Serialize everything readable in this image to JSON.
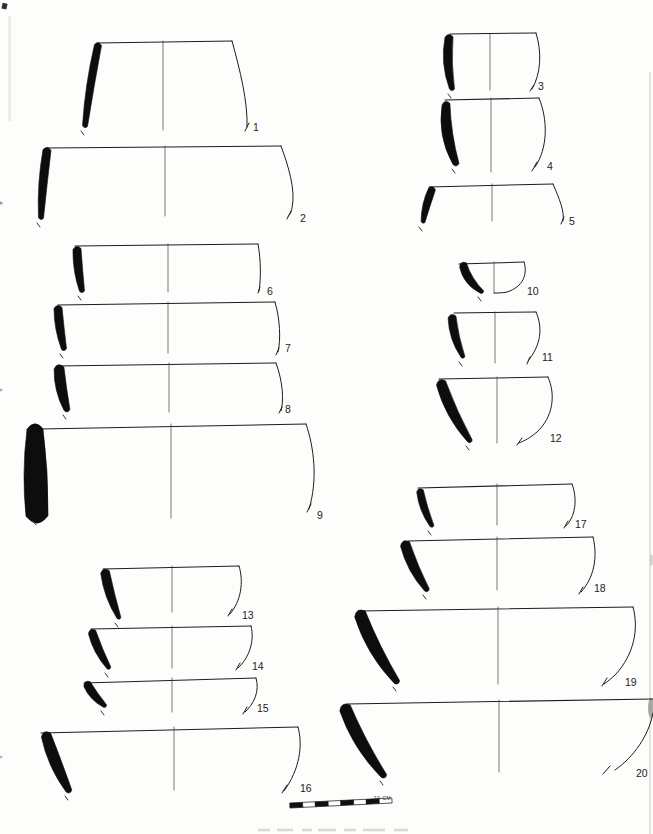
{
  "figure": {
    "type": "archaeological-pottery-profile-plate",
    "vessel_count": 20,
    "line_color": "#1d1d1d",
    "background_color": "#fdfdfc",
    "scale_bar": {
      "x": 290,
      "y": 808,
      "x2": 392,
      "y2": 803,
      "height": 5,
      "segments": 8,
      "label": "10 CM",
      "label_pos": [
        374,
        800
      ]
    },
    "vessels": [
      {
        "num": "1",
        "rim": [
          97,
          43,
          232,
          41
        ],
        "center": [
          163,
          41,
          130
        ],
        "profile": "M232,41 C240,70 248,102 247,127 M249,123 L245,131",
        "sherd": {
          "top": [
            98,
            45
          ],
          "bottom": [
            85,
            126
          ],
          "bow": -2,
          "w": [
            7,
            9,
            5
          ]
        },
        "label_pos": [
          253,
          131
        ]
      },
      {
        "num": "2",
        "rim": [
          47,
          148,
          281,
          146
        ],
        "center": [
          165,
          146,
          216
        ],
        "profile": "M281,146 C288,165 296,190 292,208 C291,213 290,215 288,216 M291,211 L287,219",
        "sherd": {
          "top": [
            47,
            150
          ],
          "bottom": [
            41,
            218
          ],
          "bow": -2,
          "w": [
            8,
            10,
            5
          ]
        },
        "label_pos": [
          300,
          222
        ]
      },
      {
        "num": "3",
        "rim": [
          450,
          34,
          536,
          33
        ],
        "center": [
          490,
          34,
          90
        ],
        "profile": "M536,33 C542,52 541,74 532,89 M534,85 L530,91",
        "sherd": {
          "top": [
            449,
            37
          ],
          "bottom": [
            452,
            89
          ],
          "bow": -5,
          "w": [
            8,
            11,
            5
          ]
        },
        "label_pos": [
          538,
          90
        ]
      },
      {
        "num": "4",
        "rim": [
          445,
          100,
          539,
          98
        ],
        "center": [
          491,
          98,
          172
        ],
        "profile": "M539,98 C548,120 548,148 535,167 M537,162 L532,171",
        "sherd": {
          "top": [
            446,
            104
          ],
          "bottom": [
            456,
            164
          ],
          "bow": -7,
          "w": [
            8,
            14,
            6
          ]
        },
        "label_pos": [
          547,
          170
        ]
      },
      {
        "num": "5",
        "rim": [
          429,
          187,
          553,
          184
        ],
        "center": [
          492,
          184,
          221
        ],
        "profile": "M553,184 C559,198 565,212 563,221 M564,217 L561,224",
        "sherd": {
          "top": [
            432,
            189
          ],
          "bottom": [
            423,
            222
          ],
          "bow": -2,
          "w": [
            7,
            9,
            4
          ]
        },
        "label_pos": [
          569,
          225
        ]
      },
      {
        "num": "6",
        "rim": [
          75,
          246,
          258,
          244
        ],
        "center": [
          168,
          244,
          292
        ],
        "profile": "M258,244 C261,260 261,279 259,291 M260,287 L258,293",
        "sherd": {
          "top": [
            77,
            249
          ],
          "bottom": [
            82,
            291
          ],
          "bow": -2,
          "w": [
            8,
            10,
            5
          ]
        },
        "label_pos": [
          267,
          295
        ]
      },
      {
        "num": "7",
        "rim": [
          58,
          305,
          275,
          302
        ],
        "center": [
          168,
          302,
          353
        ],
        "profile": "M275,302 C280,319 281,339 278,352 M279,348 L276,355",
        "sherd": {
          "top": [
            58,
            308
          ],
          "bottom": [
            64,
            349
          ],
          "bow": -2,
          "w": [
            8,
            10,
            5
          ]
        },
        "label_pos": [
          285,
          352
        ]
      },
      {
        "num": "8",
        "rim": [
          57,
          366,
          276,
          363
        ],
        "center": [
          169,
          363,
          412
        ],
        "profile": "M276,363 C283,382 284,401 281,411 M282,407 L279,413",
        "sherd": {
          "top": [
            59,
            368
          ],
          "bottom": [
            67,
            410
          ],
          "bow": -3,
          "w": [
            10,
            13,
            6
          ]
        },
        "label_pos": [
          285,
          413
        ]
      },
      {
        "num": "9",
        "rim": [
          40,
          429,
          306,
          424
        ],
        "center": [
          171,
          424,
          518
        ],
        "profile": "M306,424 C314,447 318,480 309,509 M311,504 L307,512",
        "sherd": {
          "top": [
            35,
            429
          ],
          "bottom": [
            37,
            516
          ],
          "bow": -1,
          "w": [
            16,
            27,
            22
          ]
        },
        "label_pos": [
          317,
          519
        ]
      },
      {
        "num": "10",
        "rim": [
          459,
          264,
          524,
          262
        ],
        "center": [
          494,
          262,
          293
        ],
        "profile": "M524,262 C528,274 523,287 507,292 C503,293 498,293 494,293",
        "sherd": {
          "top": [
            463,
            265
          ],
          "bottom": [
            482,
            292
          ],
          "bow": -6,
          "w": [
            8,
            10,
            4
          ]
        },
        "label_pos": [
          527,
          295
        ]
      },
      {
        "num": "11",
        "rim": [
          454,
          313,
          536,
          312
        ],
        "center": [
          495,
          312,
          363
        ],
        "profile": "M536,312 C543,328 541,345 528,361 M530,357 L527,364",
        "sherd": {
          "top": [
            452,
            317
          ],
          "bottom": [
            463,
            357
          ],
          "bow": -4,
          "w": [
            8,
            10,
            4
          ]
        },
        "label_pos": [
          542,
          361
        ]
      },
      {
        "num": "12",
        "rim": [
          439,
          379,
          548,
          377
        ],
        "center": [
          497,
          377,
          443
        ],
        "profile": "M548,377 C556,395 553,417 537,432 C530,438 524,441 519,443 M522,438 L517,445",
        "sherd": {
          "top": [
            441,
            383
          ],
          "bottom": [
            470,
            441
          ],
          "bow": -5,
          "w": [
            10,
            13,
            5
          ]
        },
        "label_pos": [
          550,
          442
        ]
      },
      {
        "num": "13",
        "rim": [
          103,
          569,
          239,
          566
        ],
        "center": [
          172,
          566,
          612
        ],
        "profile": "M239,566 C244,582 241,601 230,614 M232,609 L228,616",
        "sherd": {
          "top": [
            105,
            572
          ],
          "bottom": [
            119,
            618
          ],
          "bow": -3,
          "w": [
            9,
            11,
            4
          ]
        },
        "label_pos": [
          242,
          619
        ]
      },
      {
        "num": "14",
        "rim": [
          91,
          629,
          251,
          626
        ],
        "center": [
          172,
          626,
          668
        ],
        "profile": "M251,626 C255,641 249,658 238,668 M240,663 L236,670",
        "sherd": {
          "top": [
            92,
            632
          ],
          "bottom": [
            109,
            668
          ],
          "bow": -3,
          "w": [
            8,
            10,
            4
          ]
        },
        "label_pos": [
          252,
          670
        ]
      },
      {
        "num": "15",
        "rim": [
          84,
          683,
          256,
          678
        ],
        "center": [
          172,
          678,
          712
        ],
        "profile": "M256,678 C260,691 254,704 245,712 M247,707 L243,714",
        "sherd": {
          "top": [
            87,
            684
          ],
          "bottom": [
            105,
            706
          ],
          "bow": -3,
          "w": [
            8,
            10,
            4
          ]
        },
        "label_pos": [
          257,
          712
        ]
      },
      {
        "num": "16",
        "rim": [
          41,
          733,
          298,
          727
        ],
        "center": [
          174,
          727,
          790
        ],
        "profile": "M298,727 C303,745 300,769 284,791 M287,785 L282,793",
        "sherd": {
          "top": [
            46,
            735
          ],
          "bottom": [
            69,
            791
          ],
          "bow": -3,
          "w": [
            10,
            15,
            6
          ]
        },
        "label_pos": [
          300,
          792
        ]
      },
      {
        "num": "17",
        "rim": [
          418,
          488,
          572,
          484
        ],
        "center": [
          497,
          484,
          525
        ],
        "profile": "M572,484 C578,500 575,517 566,526 M568,521 L564,528",
        "sherd": {
          "top": [
            420,
            491
          ],
          "bottom": [
            432,
            526
          ],
          "bow": -3,
          "w": [
            7,
            9,
            4
          ]
        },
        "label_pos": [
          575,
          528
        ]
      },
      {
        "num": "18",
        "rim": [
          408,
          541,
          593,
          537
        ],
        "center": [
          497,
          537,
          590
        ],
        "profile": "M593,537 C598,557 594,578 581,592 M583,587 L579,594",
        "sherd": {
          "top": [
            405,
            544
          ],
          "bottom": [
            427,
            590
          ],
          "bow": -4,
          "w": [
            10,
            12,
            5
          ]
        },
        "label_pos": [
          594,
          592
        ]
      },
      {
        "num": "19",
        "rim": [
          358,
          611,
          633,
          607
        ],
        "center": [
          498,
          607,
          684
        ],
        "profile": "M633,607 C639,629 634,654 616,674 C611,679 607,682 604,684 M607,678 L602,686",
        "sherd": {
          "top": [
            360,
            614
          ],
          "bottom": [
            397,
            682
          ],
          "bow": -6,
          "w": [
            12,
            15,
            6
          ]
        },
        "label_pos": [
          625,
          686
        ]
      },
      {
        "num": "20",
        "rim": [
          347,
          704,
          653,
          699
        ],
        "center": [
          499,
          700,
          772
        ],
        "profile": "M653,713 C649,735 634,757 615,770 M610,766 L603,774",
        "sherd": {
          "top": [
            345,
            708
          ],
          "bottom": [
            384,
            776
          ],
          "bow": -6,
          "w": [
            12,
            15,
            6
          ]
        },
        "label_pos": [
          636,
          777
        ]
      }
    ]
  }
}
